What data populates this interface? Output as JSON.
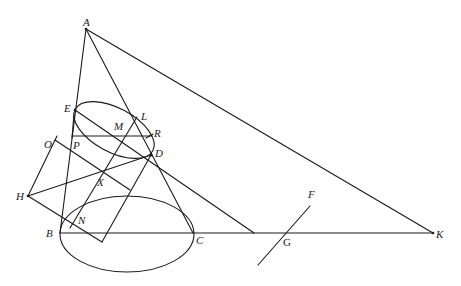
{
  "figure": {
    "type": "geometric-diagram",
    "stroke_color": "#1a1a1a",
    "background": "#ffffff"
  },
  "points": {
    "A": {
      "label": "A",
      "x": 86,
      "y": 29
    },
    "E": {
      "label": "E",
      "x": 75,
      "y": 110
    },
    "L": {
      "label": "L",
      "x": 131,
      "y": 112
    },
    "M": {
      "label": "M",
      "x": 120,
      "y": 136
    },
    "R": {
      "label": "R",
      "x": 152,
      "y": 133
    },
    "P": {
      "label": "P",
      "x": 72,
      "y": 136
    },
    "O": {
      "label": "O",
      "x": 55,
      "y": 140
    },
    "D": {
      "label": "D",
      "x": 151,
      "y": 155
    },
    "X": {
      "label": "X",
      "x": 100,
      "y": 172
    },
    "H": {
      "label": "H",
      "x": 28,
      "y": 196
    },
    "N": {
      "label": "N",
      "x": 72,
      "y": 223
    },
    "B": {
      "label": "B",
      "x": 60,
      "y": 233
    },
    "C": {
      "label": "C",
      "x": 193,
      "y": 233
    },
    "G": {
      "label": "G",
      "x": 254,
      "y": 233
    },
    "F": {
      "label": "F",
      "x": 310,
      "y": 206
    },
    "K": {
      "label": "K",
      "x": 433,
      "y": 233
    }
  },
  "labels": [
    {
      "id": "A",
      "text": "A",
      "x": 83,
      "y": 26
    },
    {
      "id": "E",
      "text": "E",
      "x": 64,
      "y": 112
    },
    {
      "id": "L",
      "text": "L",
      "x": 141,
      "y": 120
    },
    {
      "id": "M",
      "text": "M",
      "x": 114,
      "y": 130
    },
    {
      "id": "R",
      "text": "R",
      "x": 154,
      "y": 137
    },
    {
      "id": "P",
      "text": "P",
      "x": 73,
      "y": 149
    },
    {
      "id": "O",
      "text": "O",
      "x": 44,
      "y": 148
    },
    {
      "id": "D",
      "text": "D",
      "x": 155,
      "y": 157
    },
    {
      "id": "X",
      "text": "X",
      "x": 97,
      "y": 186
    },
    {
      "id": "H",
      "text": "H",
      "x": 16,
      "y": 200
    },
    {
      "id": "N",
      "text": "N",
      "x": 78,
      "y": 224
    },
    {
      "id": "B",
      "text": "B",
      "x": 46,
      "y": 237
    },
    {
      "id": "C",
      "text": "C",
      "x": 196,
      "y": 244
    },
    {
      "id": "G",
      "text": "G",
      "x": 283,
      "y": 246
    },
    {
      "id": "F",
      "text": "F",
      "x": 308,
      "y": 198
    },
    {
      "id": "K",
      "text": "K",
      "x": 436,
      "y": 238
    }
  ]
}
